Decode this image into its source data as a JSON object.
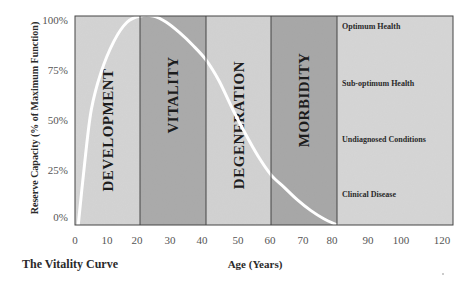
{
  "chart_data": {
    "type": "line",
    "title": "The Vitality Curve",
    "xlabel": "Age (Years)",
    "ylabel": "Reserve Capacity (% of Maximum Function)",
    "x_ticks": [
      0,
      10,
      20,
      30,
      40,
      50,
      60,
      70,
      80,
      90,
      100,
      120
    ],
    "y_ticks": [
      "0%",
      "25%",
      "50%",
      "75%",
      "100%"
    ],
    "xlim": [
      0,
      120
    ],
    "ylim": [
      0,
      100
    ],
    "grid": false,
    "bands": [
      {
        "label": "DEVELOPMENT",
        "from": 0,
        "to": 20,
        "color": "#d4d4d4"
      },
      {
        "label": "VITALITY",
        "from": 20,
        "to": 40,
        "color": "#a9a9a9"
      },
      {
        "label": "DEGENERATION",
        "from": 40,
        "to": 60,
        "color": "#d2d2d2"
      },
      {
        "label": "MORBIDITY",
        "from": 60,
        "to": 80,
        "color": "#a6a6a6"
      },
      {
        "label": "",
        "from": 80,
        "to": 120,
        "color": "#d6d6d6"
      }
    ],
    "status_labels": [
      {
        "label": "Optimum Health",
        "level": 100
      },
      {
        "label": "Sub-optimum Health",
        "level": 75
      },
      {
        "label": "Undiagnosed Conditions",
        "level": 50
      },
      {
        "label": "Clinical Disease",
        "level": 25
      }
    ],
    "series": [
      {
        "name": "Vitality Curve",
        "color": "#ffffff",
        "x": [
          1,
          3,
          5,
          8,
          12,
          16,
          20,
          24,
          28,
          32,
          36,
          40,
          44,
          48,
          52,
          56,
          60,
          64,
          68,
          72,
          76,
          80
        ],
        "y": [
          0,
          30,
          55,
          73,
          88,
          97,
          100,
          100,
          97,
          92,
          86,
          79,
          69,
          56,
          44,
          33,
          24,
          18,
          12,
          7,
          3,
          0
        ]
      }
    ]
  }
}
